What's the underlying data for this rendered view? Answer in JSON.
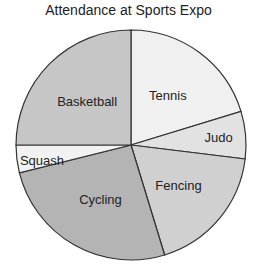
{
  "chart_data": {
    "type": "pie",
    "title": "Attendance at Sports Expo",
    "start_angle_deg": 90,
    "direction": "clockwise",
    "slices": [
      {
        "label": "Tennis",
        "angle_deg": 73,
        "percent": 20.3,
        "color": "#f0f0f0"
      },
      {
        "label": "Judo",
        "angle_deg": 24,
        "percent": 6.7,
        "color": "#e2e2e2"
      },
      {
        "label": "Fencing",
        "angle_deg": 66,
        "percent": 18.3,
        "color": "#d0d0d0"
      },
      {
        "label": "Cycling",
        "angle_deg": 93,
        "percent": 25.8,
        "color": "#b4b4b4"
      },
      {
        "label": "Squash",
        "angle_deg": 14,
        "percent": 3.9,
        "color": "#f2f2f2"
      },
      {
        "label": "Basketball",
        "angle_deg": 90,
        "percent": 25.0,
        "color": "#c6c6c6"
      }
    ],
    "legend": "none (labels inside slices)"
  }
}
